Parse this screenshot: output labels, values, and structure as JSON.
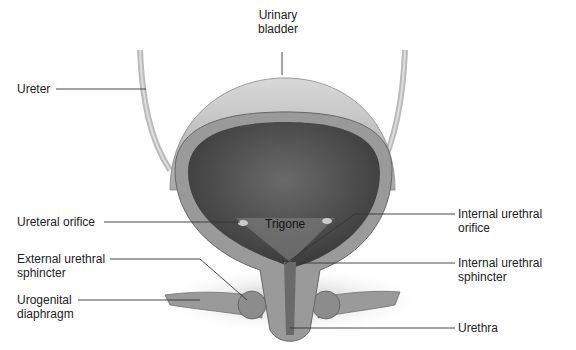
{
  "diagram": {
    "labels": {
      "urinary_bladder": {
        "line1": "Urinary",
        "line2": "bladder"
      },
      "ureter": "Ureter",
      "ureteral_orifice": "Ureteral orifice",
      "trigone": "Trigone",
      "internal_urethral_orifice": {
        "line1": "Internal urethral",
        "line2": "orifice"
      },
      "external_urethral_sphincter": {
        "line1": "External urethral",
        "line2": "sphincter"
      },
      "internal_urethral_sphincter": {
        "line1": "Internal urethral",
        "line2": "sphincter"
      },
      "urogenital_diaphragm": {
        "line1": "Urogenital",
        "line2": "diaphragm"
      },
      "urethra": "Urethra"
    },
    "colors": {
      "outer_wall": "#c8c8c8",
      "lumen": "#4a4a4a",
      "muscle": "#9a9a9a",
      "leader_line": "#333333",
      "text": "#222222"
    }
  }
}
